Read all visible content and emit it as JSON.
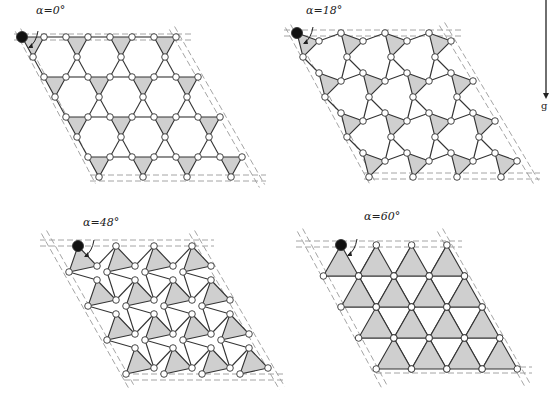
{
  "figure": {
    "colors": {
      "triangle_fill": "#cfcfcf",
      "edge": "#333333",
      "vertex_fill": "#ffffff",
      "pinned_vertex": "#111111",
      "boundary_dash": "#9a9a9a",
      "background": "#ffffff"
    },
    "gravity": {
      "label": "g",
      "arrow_x": 546,
      "arrow_top": 0,
      "arrow_bottom": 98
    },
    "panels": [
      {
        "id": "alpha-0",
        "label": "α=0°",
        "label_pos": [
          36,
          14
        ],
        "angle_deg": 0,
        "origin": [
          22,
          37
        ],
        "a1": [
          44,
          0
        ],
        "a2": [
          22,
          40
        ],
        "cols": 4,
        "rows": 4,
        "tri": [
          [
            0,
            0
          ],
          [
            22,
            0
          ],
          [
            11,
            20
          ]
        ],
        "top_y": 37,
        "bottom_y": 178,
        "left_line": [
          [
            18,
            30
          ],
          [
            98,
            182
          ]
        ],
        "right_line": [
          [
            172,
            28
          ],
          [
            262,
            186
          ]
        ]
      },
      {
        "id": "alpha-18",
        "label": "α=18°",
        "label_pos": [
          306,
          14
        ],
        "angle_deg": 18,
        "origin": [
          297,
          33
        ],
        "a1": [
          44,
          0
        ],
        "a2": [
          22,
          40
        ],
        "cols": 4,
        "rows": 4,
        "tri": [
          [
            0,
            0
          ],
          [
            22,
            8
          ],
          [
            6,
            24
          ]
        ],
        "top_y": 33,
        "bottom_y": 176,
        "left_line": [
          [
            288,
            26
          ],
          [
            372,
            182
          ]
        ],
        "right_line": [
          [
            442,
            24
          ],
          [
            536,
            182
          ]
        ]
      },
      {
        "id": "alpha-48",
        "label": "α=48°",
        "label_pos": [
          83,
          226
        ],
        "angle_deg": 48,
        "origin": [
          78,
          246
        ],
        "a1": [
          38,
          0
        ],
        "a2": [
          19,
          34
        ],
        "cols": 4,
        "rows": 4,
        "tri": [
          [
            0,
            0
          ],
          [
            19,
            20
          ],
          [
            -9,
            26
          ]
        ],
        "top_y": 243,
        "bottom_y": 377,
        "left_line": [
          [
            44,
            232
          ],
          [
            132,
            388
          ]
        ],
        "right_line": [
          [
            192,
            232
          ],
          [
            282,
            388
          ]
        ]
      },
      {
        "id": "alpha-60",
        "label": "α=60°",
        "label_pos": [
          364,
          220
        ],
        "angle_deg": 60,
        "origin": [
          341,
          245
        ],
        "a1": [
          35.3,
          0
        ],
        "a2": [
          17.6,
          31
        ],
        "cols": 4,
        "rows": 4,
        "tri": [
          [
            0,
            0
          ],
          [
            17.6,
            31
          ],
          [
            -17.6,
            31
          ]
        ],
        "top_y": 244,
        "bottom_y": 370,
        "left_line": [
          [
            300,
            230
          ],
          [
            384,
            386
          ]
        ],
        "right_line": [
          [
            440,
            230
          ],
          [
            528,
            386
          ]
        ]
      }
    ]
  }
}
